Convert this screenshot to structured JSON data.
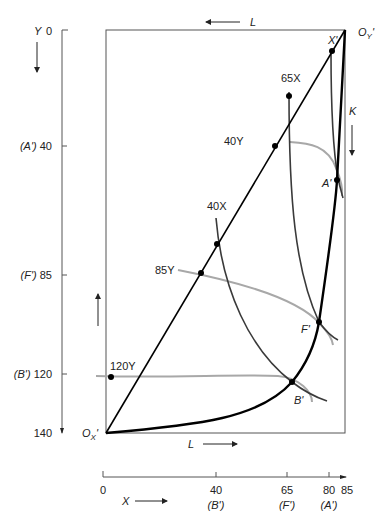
{
  "diagram": {
    "type": "Edgeworth box (production)",
    "top_label": {
      "arrow": "←",
      "text": "L"
    },
    "bottom_label": {
      "text": "L",
      "arrow": "→"
    },
    "right_label": {
      "text": "K",
      "arrow": "↓"
    },
    "origin_x": {
      "base": "O",
      "sub": "X",
      "prime": "'"
    },
    "origin_y": {
      "base": "O",
      "sub": "Y",
      "prime": "'"
    },
    "left_axis": {
      "title": "Y",
      "ticks": [
        {
          "value": "0",
          "prefix": ""
        },
        {
          "value": "40",
          "prefix": "(A')"
        },
        {
          "value": "85",
          "prefix": "(F')"
        },
        {
          "value": "120",
          "prefix": "(B')"
        },
        {
          "value": "140",
          "prefix": ""
        }
      ]
    },
    "bottom_axis": {
      "title": "X",
      "ticks": [
        {
          "value": "0",
          "sub": ""
        },
        {
          "value": "40",
          "sub": "(B')"
        },
        {
          "value": "65",
          "sub": "(F')"
        },
        {
          "value": "80",
          "sub": "(A')"
        },
        {
          "value": "85",
          "sub": ""
        }
      ]
    },
    "isoquant_labels": {
      "x65": "65X",
      "x40": "40X",
      "y40": "40Y",
      "y85": "85Y",
      "y120": "120Y"
    },
    "points": {
      "x_prime": "X'",
      "a_prime": "A'",
      "f_prime": "F'",
      "b_prime": "B'"
    },
    "colors": {
      "contract_curve": "#000000",
      "x_isoquants": "#3a3a3a",
      "y_isoquants": "#a8a8a8",
      "box": "#555555"
    }
  }
}
